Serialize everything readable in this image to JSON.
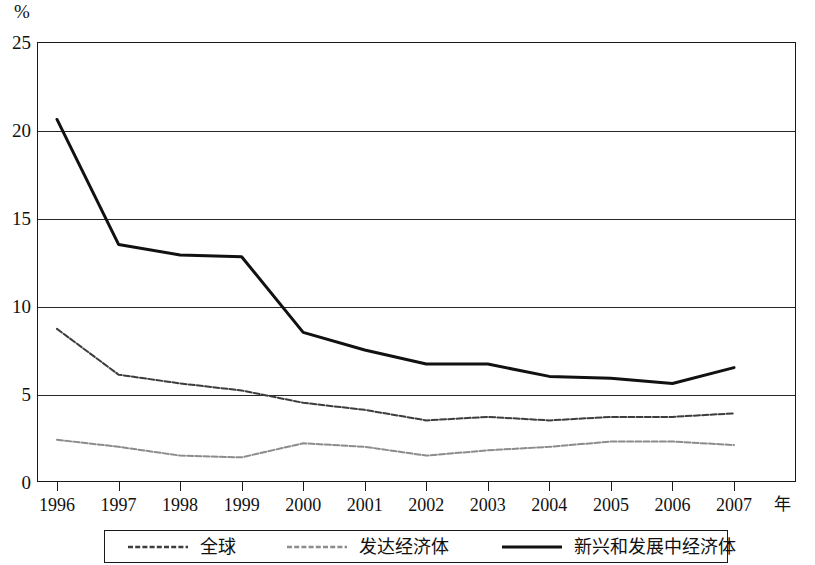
{
  "axes": {
    "y_unit_label": "%",
    "y_ticks": [
      "25",
      "20",
      "15",
      "10",
      "5",
      "0"
    ],
    "x_ticks": [
      "1996",
      "1997",
      "1998",
      "1999",
      "2000",
      "2001",
      "2002",
      "2003",
      "2004",
      "2005",
      "2006",
      "2007"
    ],
    "x_unit_label": "年"
  },
  "legend": {
    "items": [
      {
        "label": "全球",
        "style": "dashed-dark",
        "color": "#3d3d3d"
      },
      {
        "label": "发达经济体",
        "style": "dashed-light",
        "color": "#8c8c8c"
      },
      {
        "label": "新兴和发展中经济体",
        "style": "solid-black",
        "color": "#111111"
      }
    ]
  },
  "chart_data": {
    "type": "line",
    "title": "",
    "xlabel": "年",
    "ylabel": "%",
    "xlim": [
      1996,
      2007
    ],
    "ylim": [
      0,
      25
    ],
    "yticks": [
      0,
      5,
      10,
      15,
      20,
      25
    ],
    "grid": true,
    "legend_position": "bottom",
    "x": [
      1996,
      1997,
      1998,
      1999,
      2000,
      2001,
      2002,
      2003,
      2004,
      2005,
      2006,
      2007
    ],
    "series": [
      {
        "name": "新兴和发展中经济体",
        "color": "#111111",
        "style": "solid",
        "width": 3.0,
        "values": [
          20.6,
          13.5,
          12.9,
          12.8,
          8.5,
          7.5,
          6.7,
          6.7,
          6.0,
          5.9,
          5.6,
          6.5
        ]
      },
      {
        "name": "全球",
        "color": "#3d3d3d",
        "style": "dashed",
        "width": 2.0,
        "values": [
          8.7,
          6.1,
          5.6,
          5.2,
          4.5,
          4.1,
          3.5,
          3.7,
          3.5,
          3.7,
          3.7,
          3.9
        ]
      },
      {
        "name": "发达经济体",
        "color": "#8c8c8c",
        "style": "dashed",
        "width": 2.0,
        "values": [
          2.4,
          2.0,
          1.5,
          1.4,
          2.2,
          2.0,
          1.5,
          1.8,
          2.0,
          2.3,
          2.3,
          2.1
        ]
      }
    ]
  }
}
